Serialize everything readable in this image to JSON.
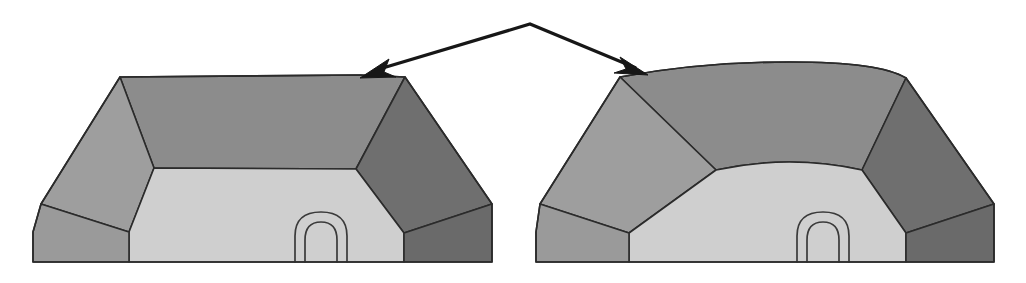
{
  "figure": {
    "title": "Two three-dimensional bin shapes linked by a double-headed arrow",
    "background_color": "#ffffff",
    "width": 1026,
    "height": 283,
    "palette": {
      "back_wall": "#8c8c8c",
      "left_wall": "#9e9e9e",
      "right_wall": "#6f6f6f",
      "floor": "#cfcfcf",
      "left_rim": "#9a9a9a",
      "right_rim": "#6a6a6a",
      "outline": "#2b2b2b",
      "arrow": "#171717",
      "arch_line": "#3a3a3a"
    },
    "objects": [
      {
        "id": "left-shape",
        "name": "rectangular-bin",
        "description": "Straight-edged trapezoidal bin viewed from above-front",
        "faces": [
          {
            "name": "back-wall",
            "tone": "#8c8c8c"
          },
          {
            "name": "left-wall",
            "tone": "#9e9e9e"
          },
          {
            "name": "right-wall",
            "tone": "#6f6f6f"
          },
          {
            "name": "floor",
            "tone": "#cfcfcf"
          },
          {
            "name": "left-front-rim",
            "tone": "#9a9a9a"
          },
          {
            "name": "right-front-rim",
            "tone": "#6a6a6a"
          }
        ],
        "arch": {
          "name": "double-arch-opening",
          "outer_width": 52,
          "inner_width": 32
        }
      },
      {
        "id": "right-shape",
        "name": "rounded-bin",
        "description": "Curved-edge bin with bowed top rim and rounded floor boundary",
        "faces": [
          {
            "name": "back-wall",
            "tone": "#8c8c8c"
          },
          {
            "name": "left-wall",
            "tone": "#9e9e9e"
          },
          {
            "name": "right-wall",
            "tone": "#6f6f6f"
          },
          {
            "name": "floor",
            "tone": "#cfcfcf"
          },
          {
            "name": "left-front-rim",
            "tone": "#9a9a9a"
          },
          {
            "name": "right-front-rim",
            "tone": "#6a6a6a"
          }
        ],
        "arch": {
          "name": "double-arch-opening",
          "outer_width": 52,
          "inner_width": 32
        }
      }
    ],
    "connector": {
      "name": "double-headed-arrow",
      "apex": {
        "x": 530,
        "y": 24
      },
      "left_tip": {
        "x": 360,
        "y": 78
      },
      "right_tip": {
        "x": 648,
        "y": 75
      },
      "heads": 2,
      "color": "#171717"
    }
  }
}
